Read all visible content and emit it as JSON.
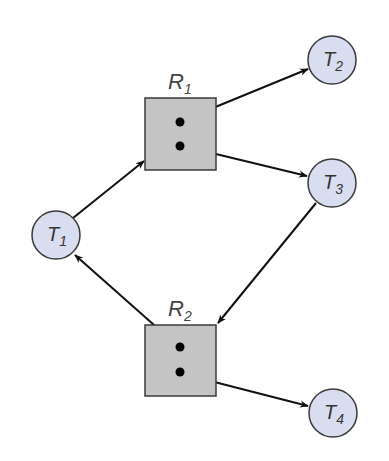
{
  "diagram": {
    "type": "resource-allocation-graph",
    "colors": {
      "thread_fill": "#d8def0",
      "thread_stroke": "#3a3a3a",
      "resource_fill": "#c4c4c4",
      "resource_stroke": "#3a3a3a",
      "edge": "#111111",
      "dot": "#000000"
    },
    "threads": [
      {
        "id": "T1",
        "label": "T",
        "sub": "1",
        "cx": 56,
        "cy": 235
      },
      {
        "id": "T2",
        "label": "T",
        "sub": "2",
        "cx": 332,
        "cy": 60
      },
      {
        "id": "T3",
        "label": "T",
        "sub": "3",
        "cx": 332,
        "cy": 183
      },
      {
        "id": "T4",
        "label": "T",
        "sub": "4",
        "cx": 333,
        "cy": 413
      }
    ],
    "resources": [
      {
        "id": "R1",
        "label": "R",
        "sub": "1",
        "instances": 2,
        "x": 145,
        "y": 98
      },
      {
        "id": "R2",
        "label": "R",
        "sub": "2",
        "instances": 2,
        "x": 145,
        "y": 325
      }
    ],
    "edges": [
      {
        "from": "T1",
        "to": "R1",
        "kind": "request"
      },
      {
        "from": "R1",
        "to": "T2",
        "kind": "assignment"
      },
      {
        "from": "R1",
        "to": "T3",
        "kind": "assignment"
      },
      {
        "from": "T3",
        "to": "R2",
        "kind": "request"
      },
      {
        "from": "R2",
        "to": "T1",
        "kind": "assignment"
      },
      {
        "from": "R2",
        "to": "T4",
        "kind": "assignment"
      }
    ]
  }
}
